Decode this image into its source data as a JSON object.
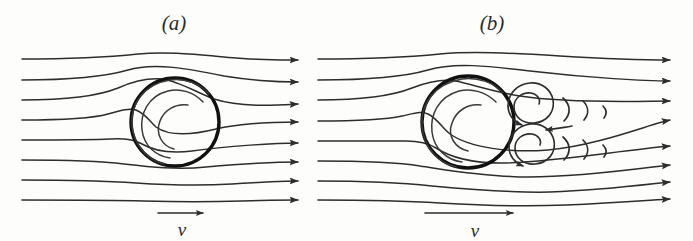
{
  "figure": {
    "background_color": "#fdfdfc",
    "ink_color": "#2d2d2d",
    "width": 693,
    "height": 241
  },
  "panels": [
    {
      "id": "a",
      "caption": "(a)",
      "caption_x": 174,
      "caption_y": 30,
      "regime": "laminar",
      "velocity_label": "v",
      "velocity_label_x": 182,
      "velocity_label_y": 235,
      "velocity_arrow": {
        "x1": 158,
        "y1": 213,
        "x2": 205,
        "y2": 213
      },
      "sphere": {
        "cx": 175,
        "cy": 122,
        "r": 44
      },
      "streamline_count": 8,
      "has_wake_vortices": false
    },
    {
      "id": "b",
      "caption": "(b)",
      "caption_x": 492,
      "caption_y": 30,
      "regime": "turbulent",
      "velocity_label": "v",
      "velocity_label_x": 475,
      "velocity_label_y": 237,
      "velocity_arrow": {
        "x1": 425,
        "y1": 213,
        "x2": 515,
        "y2": 213
      },
      "sphere": {
        "cx": 468,
        "cy": 122,
        "r": 46
      },
      "streamline_count": 8,
      "has_wake_vortices": true,
      "wake_vortex_count": 2,
      "wake_arc_rows": 2,
      "wake_arcs_per_row": 3
    }
  ],
  "icons": {
    "flow_arrowhead": "arrowhead-right",
    "velocity_arrow": "arrow-right",
    "vortex": "spiral-swirl"
  }
}
